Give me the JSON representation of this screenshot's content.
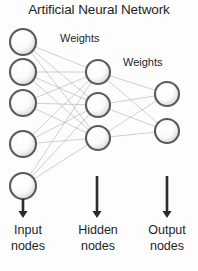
{
  "title": "Artificial Neural Network",
  "labels": {
    "weights_1": "Weights",
    "weights_2": "Weights",
    "input_line1": "Input",
    "input_line2": "nodes",
    "hidden_line1": "Hidden",
    "hidden_line2": "nodes",
    "output_line1": "Output",
    "output_line2": "nodes"
  },
  "colors": {
    "background": "#fdfdfd",
    "node_stroke": "#5a5a5a",
    "node_fill_center": "#ffffff",
    "node_fill_edge": "#d9d9d9",
    "edge": "#9a9a9a",
    "arrow": "#2b2b2b",
    "text": "#1f1f1f"
  },
  "chart_data": {
    "type": "diagram",
    "title": "Artificial Neural Network",
    "layers": [
      {
        "name": "Input nodes",
        "count": 5,
        "x": 23,
        "radius": 13,
        "node_y": [
          42,
          72,
          103,
          144,
          186
        ]
      },
      {
        "name": "Hidden nodes",
        "count": 3,
        "x": 98,
        "radius": 12,
        "node_y": [
          72,
          105,
          138
        ]
      },
      {
        "name": "Output nodes",
        "count": 2,
        "x": 167,
        "radius": 12,
        "node_y": [
          94,
          131
        ]
      }
    ],
    "connections": [
      {
        "from": "Input nodes",
        "to": "Hidden nodes",
        "type": "fully-connected",
        "count": 15,
        "label": "Weights"
      },
      {
        "from": "Hidden nodes",
        "to": "Output nodes",
        "type": "fully-connected",
        "count": 6,
        "label": "Weights"
      }
    ],
    "annotations": [
      {
        "text": "Weights",
        "x": 60,
        "y": 32
      },
      {
        "text": "Weights",
        "x": 123,
        "y": 56
      }
    ],
    "arrows": [
      {
        "label": "Input nodes",
        "x": 23,
        "y_start": 199,
        "y_end": 218
      },
      {
        "label": "Hidden nodes",
        "x": 97,
        "y_start": 176,
        "y_end": 218
      },
      {
        "label": "Output nodes",
        "x": 167,
        "y_start": 176,
        "y_end": 218
      }
    ]
  }
}
